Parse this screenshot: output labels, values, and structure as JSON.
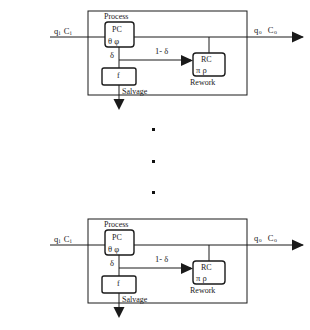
{
  "figure": {
    "type": "block-flow-diagram",
    "stage_count_shown": 2,
    "ellipsis_dot_count": 3,
    "colors": {
      "line": "#1a1a1a",
      "background": "#ffffff",
      "text": "#1a1a1a"
    }
  },
  "stage": {
    "outer_label": "Process",
    "input_label": {
      "q": "q",
      "q_sub": "i",
      "c": "C",
      "c_sub": "i",
      "full": "qi C i"
    },
    "output_label": {
      "q": "q",
      "q_sub": "o",
      "c": "C",
      "c_sub": "o",
      "full": "qo C o"
    },
    "production_center": {
      "name": "PC",
      "params": "θ  φ",
      "caption": "Process"
    },
    "rework_center": {
      "name": "RC",
      "params": "π   ρ",
      "caption": "Rework"
    },
    "salvage_block": {
      "name": "f",
      "caption": "Salvage"
    },
    "branch_labels": {
      "defective_fraction": "δ",
      "reworkable_fraction": "1- δ"
    }
  },
  "stages": [
    {
      "id": "stage-top",
      "y_offset": 0
    },
    {
      "id": "stage-bottom",
      "y_offset": 208
    }
  ]
}
